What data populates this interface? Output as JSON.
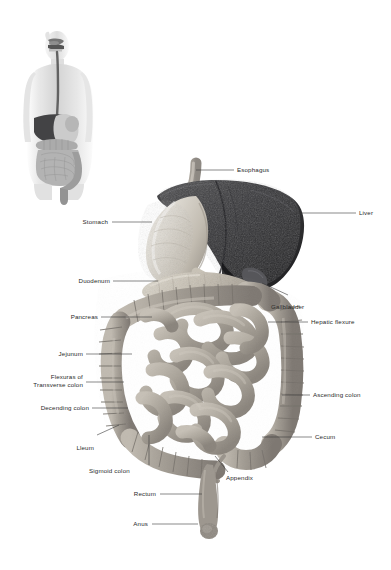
{
  "figure": {
    "background_color": "#ffffff",
    "label_color": "#2a2a2a",
    "leader_line_color": "#3a3a3a",
    "inset": {
      "name": "full-body-digestive-tract-inset",
      "description": "Grayscale human torso showing digestive tract in situ"
    }
  },
  "labels": {
    "esophagus": "Esophagus",
    "liver": "Liver",
    "stomach": "Stomach",
    "duodenum": "Duodenum",
    "gallbladder": "Gallbladder",
    "hepatic_flexure": "Hepatic flexure",
    "pancreas": "Pancreas",
    "jejunum": "Jejunum",
    "flexuras_line1": "Flexuras of",
    "flexuras_line2": "Transverse colon",
    "decending_colon": "Decending colon",
    "ascending_colon": "Ascending colon",
    "ileum": "Lleum",
    "cecum": "Cecum",
    "sigmoid_colon": "Sigmoid colon",
    "appendix": "Appendix",
    "rectum": "Rectum",
    "anus": "Anus"
  },
  "organs": {
    "liver": {
      "name": "liver",
      "tone": "#3a3a3c"
    },
    "stomach": {
      "name": "stomach",
      "tone": "#d8d4cc"
    },
    "esophagus": {
      "name": "esophagus",
      "tone": "#b9b4ab"
    },
    "pancreas": {
      "name": "pancreas",
      "tone": "#cfc9bd"
    },
    "duodenum": {
      "name": "duodenum",
      "tone": "#c9c3b6"
    },
    "large_intestine": {
      "name": "large-intestine",
      "tone": "#a8a29a"
    },
    "small_intestine": {
      "name": "small-intestine",
      "tone": "#b5afa5"
    },
    "rectum": {
      "name": "rectum",
      "tone": "#9d978f"
    },
    "gallbladder": {
      "name": "gallbladder",
      "tone": "#56565a"
    },
    "appendix": {
      "name": "appendix",
      "tone": "#9a948c"
    }
  }
}
